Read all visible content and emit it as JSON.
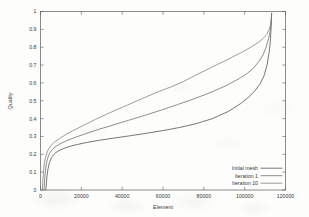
{
  "chart_data": {
    "type": "line",
    "title": "",
    "xlabel": "Element",
    "ylabel": "Quality",
    "xlim": [
      0,
      120000
    ],
    "ylim": [
      0,
      1
    ],
    "grid": false,
    "legend_position": "bottom-right",
    "xticks": [
      0,
      20000,
      40000,
      60000,
      80000,
      100000,
      120000
    ],
    "xtick_labels": [
      "0",
      "20000",
      "40000",
      "60000",
      "80000",
      "100000",
      "120000"
    ],
    "yticks": [
      0,
      0.1,
      0.2,
      0.3,
      0.4,
      0.5,
      0.6,
      0.7,
      0.8,
      0.9,
      1
    ],
    "ytick_labels": [
      "0",
      "0.1",
      "0.2",
      "0.3",
      "0.4",
      "0.5",
      "0.6",
      "0.7",
      "0.8",
      "0.9",
      "1"
    ],
    "series": [
      {
        "name": "Initial mesh",
        "color": "#4a4a4a",
        "x": [
          2600,
          2900,
          3200,
          3700,
          4400,
          5400,
          6800,
          8600,
          11000,
          14000,
          18000,
          23000,
          29000,
          36000,
          44000,
          52000,
          60000,
          68000,
          76000,
          84000,
          92000,
          98000,
          102000,
          105000,
          107500,
          109500,
          111000,
          112000,
          112600,
          113000,
          113200
        ],
        "y": [
          0.0,
          0.04,
          0.08,
          0.12,
          0.155,
          0.182,
          0.203,
          0.218,
          0.231,
          0.243,
          0.255,
          0.267,
          0.279,
          0.291,
          0.304,
          0.318,
          0.333,
          0.35,
          0.371,
          0.399,
          0.44,
          0.484,
          0.52,
          0.556,
          0.593,
          0.64,
          0.702,
          0.772,
          0.835,
          0.92,
          0.99
        ]
      },
      {
        "name": "Iteration 1",
        "color": "#6a6a6a",
        "x": [
          1700,
          1950,
          2250,
          2700,
          3400,
          4400,
          5800,
          7600,
          10000,
          13000,
          17000,
          22000,
          28000,
          35000,
          43000,
          51000,
          59000,
          67000,
          75000,
          83000,
          91000,
          97000,
          101500,
          104500,
          107000,
          109000,
          110500,
          111700,
          112500,
          113000,
          113200
        ],
        "y": [
          0.0,
          0.045,
          0.09,
          0.135,
          0.175,
          0.205,
          0.228,
          0.245,
          0.261,
          0.277,
          0.295,
          0.315,
          0.338,
          0.362,
          0.39,
          0.418,
          0.447,
          0.478,
          0.51,
          0.545,
          0.585,
          0.622,
          0.655,
          0.686,
          0.72,
          0.757,
          0.8,
          0.848,
          0.89,
          0.945,
          0.99
        ]
      },
      {
        "name": "Iteration 10",
        "color": "#7e7e7e",
        "x": [
          900,
          1150,
          1450,
          1900,
          2600,
          3600,
          5000,
          6800,
          9200,
          12000,
          16000,
          21000,
          27000,
          34000,
          42000,
          50000,
          58000,
          64000,
          70000,
          77000,
          85000,
          92000,
          98000,
          103000,
          106500,
          109000,
          110800,
          112000,
          112700,
          113050,
          113200
        ],
        "y": [
          0.0,
          0.05,
          0.1,
          0.15,
          0.19,
          0.222,
          0.248,
          0.268,
          0.287,
          0.308,
          0.333,
          0.362,
          0.396,
          0.433,
          0.473,
          0.513,
          0.552,
          0.578,
          0.608,
          0.649,
          0.694,
          0.733,
          0.768,
          0.8,
          0.825,
          0.848,
          0.872,
          0.9,
          0.926,
          0.958,
          0.99
        ]
      }
    ]
  },
  "legend": {
    "entries": [
      {
        "label": "Initial mesh"
      },
      {
        "label": "Iteration 1"
      },
      {
        "label": "Iteration 10"
      }
    ]
  }
}
